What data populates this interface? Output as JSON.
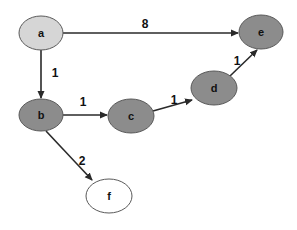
{
  "graph": {
    "type": "directed-weighted-graph",
    "colors": {
      "visited": "#d6d6d6",
      "processed": "#8c8c8c",
      "unvisited": "#ffffff",
      "stroke": "#5a5a5a",
      "edge": "#2a2a2a"
    },
    "nodes": [
      {
        "id": "a",
        "label": "a",
        "cx": 41,
        "cy": 33,
        "rx": 22,
        "ry": 17,
        "fill": "#d6d6d6"
      },
      {
        "id": "b",
        "label": "b",
        "cx": 41,
        "cy": 115,
        "rx": 22,
        "ry": 16,
        "fill": "#8c8c8c"
      },
      {
        "id": "c",
        "label": "c",
        "cx": 131,
        "cy": 116,
        "rx": 23,
        "ry": 17,
        "fill": "#8c8c8c"
      },
      {
        "id": "d",
        "label": "d",
        "cx": 214,
        "cy": 88,
        "rx": 23,
        "ry": 17,
        "fill": "#8c8c8c"
      },
      {
        "id": "e",
        "label": "e",
        "cx": 261,
        "cy": 32,
        "rx": 22,
        "ry": 17,
        "fill": "#8c8c8c"
      },
      {
        "id": "f",
        "label": "f",
        "cx": 109,
        "cy": 196,
        "rx": 23,
        "ry": 17,
        "fill": "#ffffff"
      }
    ],
    "edges": [
      {
        "from": "a",
        "to": "e",
        "weight": "8",
        "x1": 63,
        "y1": 33,
        "x2": 238,
        "y2": 33,
        "lx": 145,
        "ly": 28
      },
      {
        "from": "a",
        "to": "b",
        "weight": "1",
        "x1": 41,
        "y1": 50,
        "x2": 41,
        "y2": 98,
        "lx": 55,
        "ly": 77
      },
      {
        "from": "b",
        "to": "c",
        "weight": "1",
        "x1": 63,
        "y1": 115,
        "x2": 107,
        "y2": 115,
        "lx": 83,
        "ly": 106
      },
      {
        "from": "c",
        "to": "d",
        "weight": "1",
        "x1": 153,
        "y1": 111,
        "x2": 192,
        "y2": 100,
        "lx": 174,
        "ly": 104
      },
      {
        "from": "d",
        "to": "e",
        "weight": "1",
        "x1": 230,
        "y1": 76,
        "x2": 257,
        "y2": 50,
        "lx": 237,
        "ly": 65
      },
      {
        "from": "b",
        "to": "f",
        "weight": "2",
        "x1": 46,
        "y1": 131,
        "x2": 92,
        "y2": 180,
        "lx": 82,
        "ly": 165
      }
    ]
  }
}
